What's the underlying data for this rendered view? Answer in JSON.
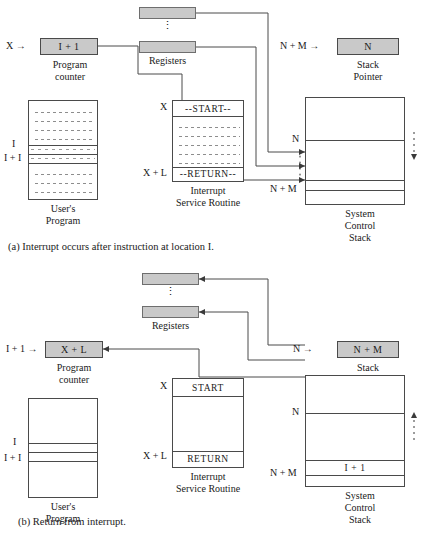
{
  "figures": [
    {
      "id": "a",
      "caption": "(a)  Interrupt occurs after instruction at location I.",
      "program_counter": {
        "prefix_label": "X  →",
        "value": "I + 1",
        "title_line1": "Program",
        "title_line2": "counter"
      },
      "registers": {
        "label": "Registers",
        "dots": "⋮"
      },
      "stack_pointer": {
        "prefix_label": "N + M  →",
        "value": "N",
        "title_line1": "Stack",
        "title_line2": "Pointer"
      },
      "user_program": {
        "title_line1": "User's",
        "title_line2": "Program",
        "marker_i": "I",
        "marker_i1": "I + I",
        "filled": true
      },
      "isr": {
        "title_line1": "Interrupt",
        "title_line2": "Service  Routine",
        "addr_start": "X",
        "addr_return": "X + L",
        "start_text": "--START--",
        "return_text": "--RETURN--",
        "filled": true
      },
      "stack": {
        "title_line1": "System",
        "title_line2": "Control",
        "title_line3": "Stack",
        "marker_n": "N",
        "marker_nm": "N + M",
        "cell_text": "",
        "side_arrow_direction": "down"
      }
    },
    {
      "id": "b",
      "caption": "(b)  Return from interrupt.",
      "program_counter": {
        "prefix_label": "I + 1  →",
        "value": "X + L",
        "title_line1": "Program",
        "title_line2": "counter"
      },
      "registers": {
        "label": "Registers",
        "dots": "⋮"
      },
      "stack_pointer": {
        "prefix_label": "N  →",
        "value": "N + M",
        "title_line1": "Stack",
        "title_line2": "Pointer"
      },
      "user_program": {
        "title_line1": "User's",
        "title_line2": "Program",
        "marker_i": "I",
        "marker_i1": "I + I",
        "filled": false
      },
      "isr": {
        "title_line1": "Interrupt",
        "title_line2": "Service  Routine",
        "addr_start": "X",
        "addr_return": "X + L",
        "start_text": "START",
        "return_text": "RETURN",
        "filled": false
      },
      "stack": {
        "title_line1": "System",
        "title_line2": "Control",
        "title_line3": "Stack",
        "marker_n": "N",
        "marker_nm": "N + M",
        "cell_text": "I + 1",
        "side_arrow_direction": "up"
      }
    }
  ],
  "colors": {
    "box_fill": "#c9c9c9",
    "line": "#4a4a4a",
    "dash": "#8d8d8d",
    "text": "#1a1a1a"
  }
}
